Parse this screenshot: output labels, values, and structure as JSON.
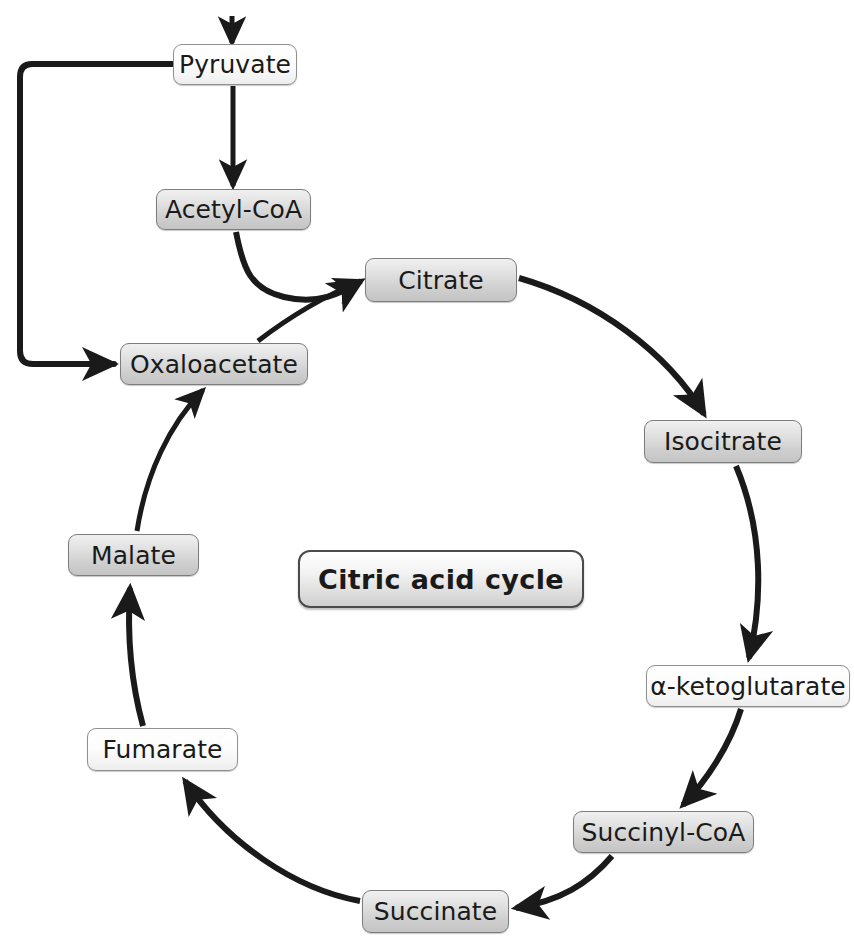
{
  "diagram": {
    "title": "Citric acid cycle",
    "center_label": "Citric acid cycle",
    "nodes": [
      {
        "id": "pyruvate",
        "label": "Pyruvate",
        "shade": "light",
        "x": 173,
        "y": 44,
        "w": 124,
        "h": 41
      },
      {
        "id": "acetyl-coa",
        "label": "Acetyl-CoA",
        "shade": "dark",
        "x": 156,
        "y": 189,
        "w": 155,
        "h": 41
      },
      {
        "id": "citrate",
        "label": "Citrate",
        "shade": "dark",
        "x": 365,
        "y": 258,
        "w": 152,
        "h": 44
      },
      {
        "id": "isocitrate",
        "label": "Isocitrate",
        "shade": "dark",
        "x": 644,
        "y": 420,
        "w": 158,
        "h": 43
      },
      {
        "id": "ketoglutarate",
        "label": "α-ketoglutarate",
        "shade": "light",
        "x": 646,
        "y": 665,
        "w": 204,
        "h": 42
      },
      {
        "id": "succinyl-coa",
        "label": "Succinyl-CoA",
        "shade": "dark",
        "x": 573,
        "y": 811,
        "w": 181,
        "h": 42
      },
      {
        "id": "succinate",
        "label": "Succinate",
        "shade": "dark",
        "x": 362,
        "y": 890,
        "w": 147,
        "h": 43
      },
      {
        "id": "fumarate",
        "label": "Fumarate",
        "shade": "light",
        "x": 87,
        "y": 728,
        "w": 151,
        "h": 43
      },
      {
        "id": "malate",
        "label": "Malate",
        "shade": "dark",
        "x": 68,
        "y": 534,
        "w": 131,
        "h": 42
      },
      {
        "id": "oxaloacetate",
        "label": "Oxaloacetate",
        "shade": "dark",
        "x": 120,
        "y": 343,
        "w": 188,
        "h": 42
      }
    ],
    "edges": [
      {
        "id": "input-to-pyruvate",
        "from": "(external input)",
        "to": "Pyruvate"
      },
      {
        "id": "pyruvate-to-acetyl-coa",
        "from": "Pyruvate",
        "to": "Acetyl-CoA"
      },
      {
        "id": "pyruvate-to-oxaloacetate",
        "from": "Pyruvate",
        "to": "Oxaloacetate"
      },
      {
        "id": "acetyl-coa-to-citrate",
        "from": "Acetyl-CoA",
        "to": "Citrate"
      },
      {
        "id": "oxaloacetate-to-citrate",
        "from": "Oxaloacetate",
        "to": "Citrate"
      },
      {
        "id": "citrate-to-isocitrate",
        "from": "Citrate",
        "to": "Isocitrate"
      },
      {
        "id": "isocitrate-to-ketoglutarate",
        "from": "Isocitrate",
        "to": "α-ketoglutarate"
      },
      {
        "id": "ketoglutarate-to-succinyl-coa",
        "from": "α-ketoglutarate",
        "to": "Succinyl-CoA"
      },
      {
        "id": "succinyl-coa-to-succinate",
        "from": "Succinyl-CoA",
        "to": "Succinate"
      },
      {
        "id": "succinate-to-fumarate",
        "from": "Succinate",
        "to": "Fumarate"
      },
      {
        "id": "fumarate-to-malate",
        "from": "Fumarate",
        "to": "Malate"
      },
      {
        "id": "malate-to-oxaloacetate",
        "from": "Malate",
        "to": "Oxaloacetate"
      }
    ],
    "center": {
      "x": 298,
      "y": 550,
      "w": 286,
      "h": 58
    },
    "colors": {
      "stroke": "#1a1a1a",
      "node_border": "#8a8a8a",
      "node_fill_light": "#f7f7f7",
      "node_fill_dark": "#d8d8d8",
      "background": "#ffffff",
      "text": "#1a1a1a"
    }
  }
}
